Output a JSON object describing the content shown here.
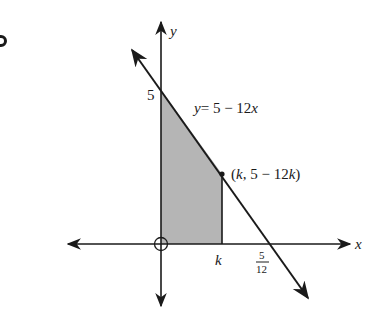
{
  "diagram": {
    "title": "",
    "axes": {
      "x_label": "x",
      "y_label": "y",
      "origin_marker": "circle"
    },
    "line": {
      "equation_label": "y = 5 − 12x",
      "y_intercept_label": "5",
      "x_intercept": {
        "numerator": "5",
        "denominator": "12"
      }
    },
    "point": {
      "label": "(k, 5 − 12k)",
      "x_label": "k"
    },
    "region": {
      "description": "shaded trapezoid between x = 0 and x = k under the line",
      "fill": "#b5b5b5"
    },
    "colors": {
      "stroke": "#1a1a1a",
      "shade": "#b5b5b5"
    },
    "labels": {
      "y_axis": "y",
      "x_axis": "x",
      "y_intercept": "5",
      "equation_y": "y",
      "equation_rest": "= 5 − 12",
      "equation_x": "x",
      "point_open": "(",
      "point_k": "k",
      "point_mid": ", 5 − 12",
      "point_k2": "k",
      "point_close": ")",
      "k_tick": "k",
      "frac_num": "5",
      "frac_den": "12"
    }
  }
}
